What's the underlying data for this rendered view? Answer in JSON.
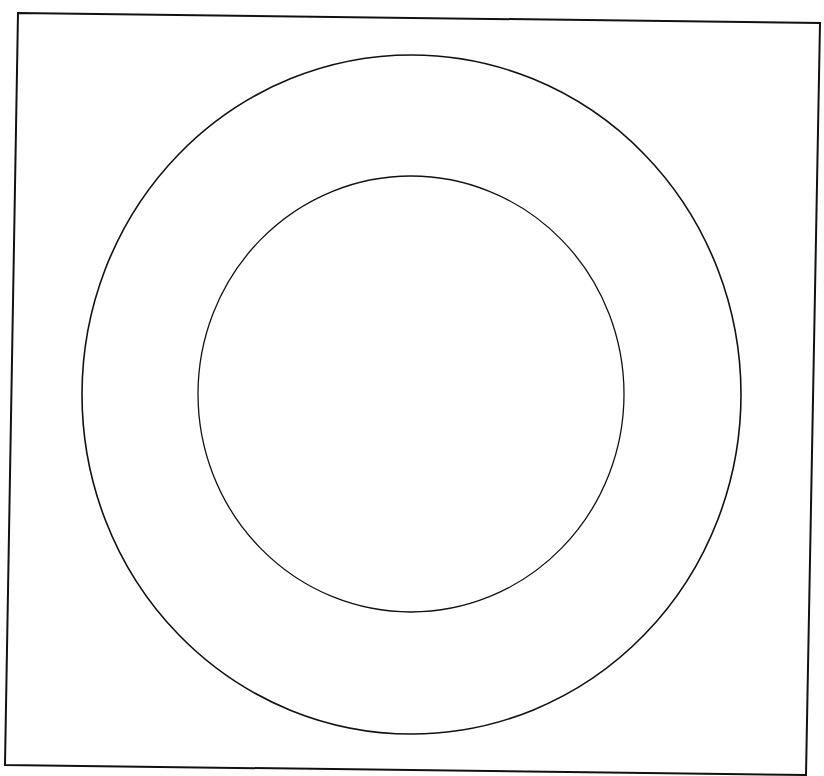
{
  "canvas": {
    "width": 824,
    "height": 776,
    "background": "#ffffff"
  },
  "stroke_color": "#111111",
  "frame": {
    "points": "18,13 820,23 806,775 5,765",
    "stroke_width": 2
  },
  "outer_ellipse": {
    "cx": 411.5,
    "cy": 394.5,
    "rx": 329.5,
    "ry": 339.5,
    "stroke_width": 1.6
  },
  "inner_ellipse": {
    "cx": 411,
    "cy": 394,
    "rx": 213,
    "ry": 218,
    "stroke_width": 1.3
  }
}
